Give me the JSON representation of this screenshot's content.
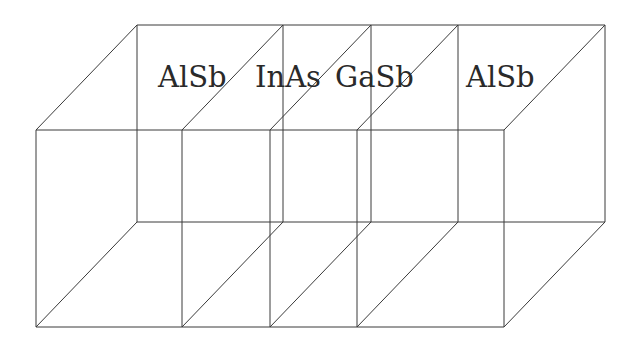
{
  "diagram": {
    "type": "layered-heterostructure-wireframe",
    "layers": [
      {
        "material": "AlSb",
        "label_x": 158
      },
      {
        "material": "InAs",
        "label_x": 255
      },
      {
        "material": "GaSb",
        "label_x": 335
      },
      {
        "material": "AlSb",
        "label_x": 466
      }
    ],
    "geometry": {
      "front_top_y": 130,
      "front_bottom_y": 327,
      "back_top_y": 25,
      "back_bottom_y": 222,
      "depth_dx": 101,
      "depth_dy": -105,
      "front_x": [
        36,
        182,
        270,
        357,
        504
      ],
      "label_baseline_y": 87
    },
    "colors": {
      "line": "#3a3a3a",
      "text": "#2a2a2a",
      "background": "#ffffff"
    }
  }
}
